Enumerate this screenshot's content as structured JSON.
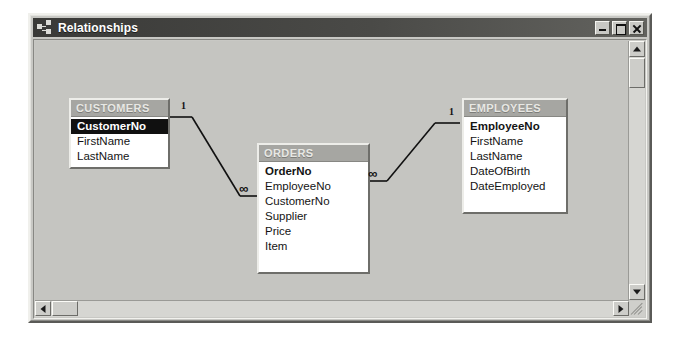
{
  "window": {
    "title": "Relationships",
    "icon": "relationships-icon",
    "controls": {
      "minimize_label": "_",
      "maximize_label": "□",
      "close_label": "×"
    }
  },
  "canvas": {
    "background_color": "#c5c5c1",
    "tables": [
      {
        "id": "customers",
        "name": "CUSTOMERS",
        "x": 62,
        "y": 70,
        "width": 101,
        "fields": [
          {
            "label": "CustomerNo",
            "primary_key": true,
            "selected": true
          },
          {
            "label": "FirstName",
            "primary_key": false,
            "selected": false
          },
          {
            "label": "LastName",
            "primary_key": false,
            "selected": false
          }
        ]
      },
      {
        "id": "orders",
        "name": "ORDERS",
        "x": 250,
        "y": 115,
        "width": 113,
        "fields": [
          {
            "label": "OrderNo",
            "primary_key": true,
            "selected": false
          },
          {
            "label": "EmployeeNo",
            "primary_key": false,
            "selected": false
          },
          {
            "label": "CustomerNo",
            "primary_key": false,
            "selected": false
          },
          {
            "label": "Supplier",
            "primary_key": false,
            "selected": false
          },
          {
            "label": "Price",
            "primary_key": false,
            "selected": false
          },
          {
            "label": "Item",
            "primary_key": false,
            "selected": false
          }
        ]
      },
      {
        "id": "employees",
        "name": "EMPLOYEES",
        "x": 455,
        "y": 70,
        "width": 106,
        "fields": [
          {
            "label": "EmployeeNo",
            "primary_key": true,
            "selected": false
          },
          {
            "label": "FirstName",
            "primary_key": false,
            "selected": false
          },
          {
            "label": "LastName",
            "primary_key": false,
            "selected": false
          },
          {
            "label": "DateOfBirth",
            "primary_key": false,
            "selected": false
          },
          {
            "label": "DateEmployed",
            "primary_key": false,
            "selected": false
          }
        ]
      }
    ],
    "relationships": [
      {
        "id": "customers-orders",
        "from_table": "CUSTOMERS",
        "from_field": "CustomerNo",
        "to_table": "ORDERS",
        "to_field": "CustomerNo",
        "one_label": "1",
        "many_label": "∞"
      },
      {
        "id": "employees-orders",
        "from_table": "EMPLOYEES",
        "from_field": "EmployeeNo",
        "to_table": "ORDERS",
        "to_field": "EmployeeNo",
        "one_label": "1",
        "many_label": "∞"
      }
    ]
  },
  "scrollbars": {
    "vertical": {
      "up_icon": "arrow-up-icon",
      "down_icon": "arrow-down-icon"
    },
    "horizontal": {
      "left_icon": "arrow-left-icon",
      "right_icon": "arrow-right-icon"
    }
  }
}
